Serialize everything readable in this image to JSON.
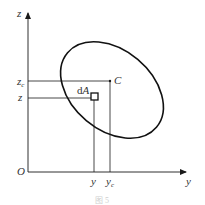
{
  "diagram": {
    "type": "centroid of plane area",
    "axes": {
      "vertical_label": "z",
      "horizontal_label": "y",
      "origin_label": "O"
    },
    "region_shape": "tilted ellipse",
    "centroid_label": "C",
    "element_label": {
      "main": "d",
      "italic": "A"
    },
    "element_coords": {
      "y": "y",
      "z": "z"
    },
    "centroid_coords": {
      "y_main": "y",
      "y_sub": "c",
      "z_main": "z",
      "z_sub": "c"
    },
    "caption": "图 5"
  },
  "colors": {
    "line": "#1a1a1a",
    "text": "#333333",
    "background": "#ffffff"
  }
}
